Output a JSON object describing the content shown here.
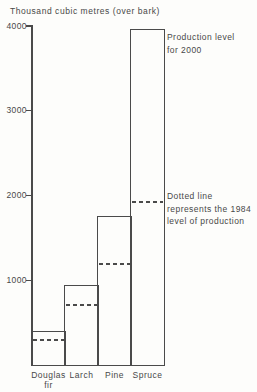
{
  "page": {
    "background": "#fdfdfb",
    "line_color": "#4a4a4a",
    "text_color": "#484848"
  },
  "chart_data": {
    "type": "bar",
    "title": "Thousand cubic metres (over bark)",
    "categories": [
      "Douglas\nfir",
      "Larch",
      "Pine",
      "Spruce"
    ],
    "series": [
      {
        "name": "Production level for 2000",
        "style": "outlined-bar",
        "values": [
          400,
          940,
          1750,
          3950
        ]
      },
      {
        "name": "1984 level of production",
        "style": "dashed-line",
        "values": [
          295,
          710,
          1190,
          1930
        ]
      }
    ],
    "ylabel": "Thousand cubic metres (over bark)",
    "xlabel": "",
    "ylim": [
      0,
      4000
    ],
    "yticks": [
      1000,
      2000,
      3000,
      4000
    ],
    "grid": false,
    "legend_position": "none",
    "annotations": [
      {
        "id": "production-2000",
        "text": "Production level\nfor 2000"
      },
      {
        "id": "dotted-1984",
        "text": "Dotted line\nrepresents the 1984\nlevel of production"
      }
    ]
  }
}
